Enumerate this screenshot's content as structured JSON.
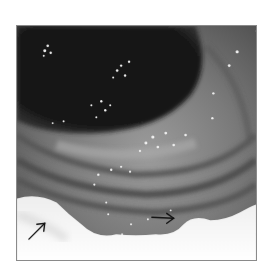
{
  "figure": {
    "colors": {
      "background": "#ffffff",
      "frame_border": "#8a8a8a",
      "lumen": "#111111",
      "mucosa_mid": "#6e6e6e",
      "mucosa_light": "#9a9a9a",
      "fold_dark": "#4a4a4a",
      "glare": "#f4f4f4",
      "arrow": "#111111"
    },
    "annotations": [
      {
        "type": "arrow",
        "direction": "up-right",
        "from": [
          12,
          215
        ],
        "to": [
          28,
          199
        ]
      },
      {
        "type": "arrow",
        "direction": "right",
        "from": [
          136,
          193
        ],
        "to": [
          158,
          194
        ]
      }
    ]
  }
}
